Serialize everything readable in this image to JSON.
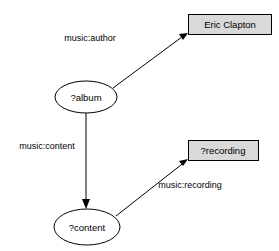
{
  "diagram": {
    "background_color": "#ffffff",
    "nodes": [
      {
        "id": "album",
        "label": "?album",
        "shape": "ellipse",
        "fill": "#ffffff",
        "stroke": "#000000",
        "cx": 86,
        "cy": 97,
        "rx": 31,
        "ry": 16
      },
      {
        "id": "content",
        "label": "?content",
        "shape": "ellipse",
        "fill": "#ffffff",
        "stroke": "#000000",
        "cx": 87,
        "cy": 227,
        "rx": 33,
        "ry": 18
      },
      {
        "id": "eric-clapton",
        "label": "Eric Clapton",
        "shape": "rectangle",
        "fill": "#d9d9d9",
        "stroke": "#000000",
        "x": 188,
        "y": 14,
        "width": 84,
        "height": 21
      },
      {
        "id": "recording",
        "label": "?recording",
        "shape": "rectangle",
        "fill": "#d9d9d9",
        "stroke": "#000000",
        "x": 188,
        "y": 140,
        "width": 71,
        "height": 21
      }
    ],
    "edges": [
      {
        "id": "album-author-ericclapton",
        "label": "music:author",
        "from": "album",
        "to": "eric-clapton",
        "x1": 113,
        "y1": 88,
        "x2": 187,
        "y2": 33,
        "label_x": 90,
        "label_y": 39
      },
      {
        "id": "album-content-content",
        "label": "music:content",
        "from": "album",
        "to": "content",
        "x1": 86,
        "y1": 113,
        "x2": 86,
        "y2": 207,
        "label_x": 47,
        "label_y": 147
      },
      {
        "id": "content-recording-recording",
        "label": "music:recording",
        "from": "content",
        "to": "recording",
        "x1": 116,
        "y1": 216,
        "x2": 187,
        "y2": 160,
        "label_x": 190,
        "label_y": 186
      }
    ]
  }
}
